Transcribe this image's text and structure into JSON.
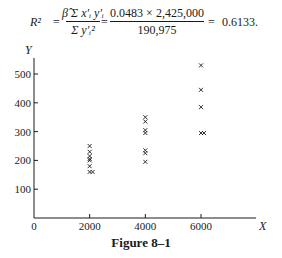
{
  "formula": {
    "lhs": "R²",
    "eq1": "=",
    "frac1_num": "β̂ Σ x′ᵢ y′ᵢ",
    "frac1_den": "Σ y′ᵢ²",
    "eq2": "=",
    "frac2_num": "0.0483 × 2,425,000",
    "frac2_den": "190,975",
    "eq3": "=",
    "result": "0.6133."
  },
  "caption": "Figure 8–1",
  "chart_data": {
    "type": "scatter",
    "title": "",
    "caption": "Figure 8–1",
    "xlabel": "X",
    "ylabel": "Y",
    "xlim": [
      0,
      7500
    ],
    "ylim": [
      0,
      550
    ],
    "x_ticks": [
      0,
      2000,
      4000,
      6000
    ],
    "x_tick_labels": [
      "0",
      "2000",
      "4000",
      "6000"
    ],
    "y_ticks": [
      100,
      200,
      300,
      400,
      500
    ],
    "y_tick_labels": [
      "100",
      "200",
      "300",
      "400",
      "500"
    ],
    "grid": false,
    "legend": null,
    "marker": "x",
    "series": [
      {
        "name": "observations",
        "points": [
          {
            "x": 2000,
            "y": 250
          },
          {
            "x": 2000,
            "y": 230
          },
          {
            "x": 2000,
            "y": 215
          },
          {
            "x": 2000,
            "y": 205
          },
          {
            "x": 2000,
            "y": 200
          },
          {
            "x": 2000,
            "y": 180
          },
          {
            "x": 2000,
            "y": 160
          },
          {
            "x": 2000,
            "y": 160
          },
          {
            "x": 4000,
            "y": 350
          },
          {
            "x": 4000,
            "y": 335
          },
          {
            "x": 4000,
            "y": 305
          },
          {
            "x": 4000,
            "y": 295
          },
          {
            "x": 4000,
            "y": 235
          },
          {
            "x": 4000,
            "y": 225
          },
          {
            "x": 4000,
            "y": 195
          },
          {
            "x": 6000,
            "y": 530
          },
          {
            "x": 6000,
            "y": 445
          },
          {
            "x": 6000,
            "y": 385
          },
          {
            "x": 6000,
            "y": 295
          },
          {
            "x": 6000,
            "y": 295
          }
        ]
      }
    ]
  }
}
